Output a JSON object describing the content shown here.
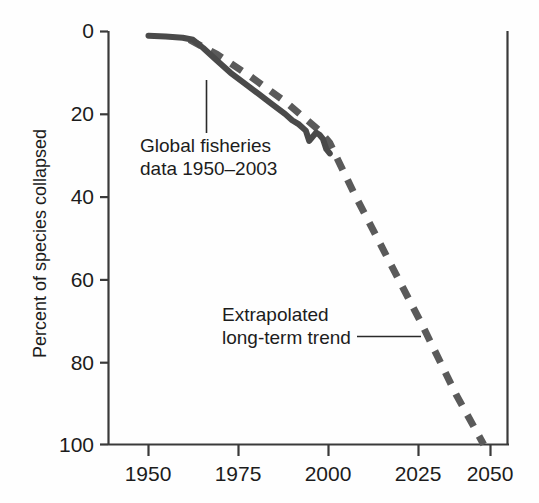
{
  "chart_data": {
    "type": "line",
    "title": "",
    "subtitle": "",
    "xlabel": "",
    "ylabel": "Percent of species collapsed",
    "xlim": [
      1950,
      2050
    ],
    "ylim": [
      0,
      100
    ],
    "y_axis_inverted": true,
    "grid": false,
    "legend_position": "none",
    "xticks": [
      1950,
      1975,
      2000,
      2025,
      2050
    ],
    "xtick_labels": [
      "1950",
      "1975",
      "2000",
      "2025",
      "2050"
    ],
    "yticks": [
      0,
      20,
      40,
      60,
      80,
      100
    ],
    "ytick_labels": [
      "0",
      "20",
      "40",
      "60",
      "80",
      "100"
    ],
    "series": [
      {
        "name": "Global fisheries data 1950-2003",
        "style": "solid",
        "color": "#4a4a4a",
        "linewidth": 6,
        "x": [
          1950,
          1955,
          1960,
          1963,
          1966,
          1970,
          1974,
          1978,
          1982,
          1986,
          1990,
          1992,
          1994,
          1996,
          1997,
          1999,
          2000,
          2001,
          2002,
          2003
        ],
        "y": [
          1,
          1.2,
          1.5,
          2,
          4,
          7,
          10,
          12.5,
          15,
          17.5,
          20,
          21.5,
          22.5,
          24,
          26.5,
          24.5,
          25,
          26,
          28.5,
          29.5
        ]
      },
      {
        "name": "Extrapolated long-term trend",
        "style": "dashed",
        "color": "#5a5a5a",
        "linewidth": 7,
        "x": [
          1962,
          1970,
          1980,
          1990,
          2000,
          2003,
          2010,
          2020,
          2030,
          2040,
          2048
        ],
        "y": [
          2,
          5.5,
          11,
          17,
          24,
          27,
          39,
          55,
          71,
          88,
          100
        ]
      }
    ],
    "annotations": [
      {
        "id": "fisheries-annotation",
        "lines": [
          "Global fisheries",
          "data 1950–2003"
        ],
        "text": "Global fisheries data 1950–2003",
        "leader": "vertical",
        "points_to_series": "Global fisheries data 1950-2003"
      },
      {
        "id": "extrapolation-annotation",
        "lines": [
          "Extrapolated",
          "long-term trend"
        ],
        "text": "Extrapolated long-term trend",
        "leader": "horizontal",
        "points_to_series": "Extrapolated long-term trend"
      }
    ],
    "colors": {
      "axis": "#3a3a3a",
      "text": "#1c1c1c",
      "solid_series": "#4a4a4a",
      "dashed_series": "#5a5a5a",
      "background": "#fefefe"
    }
  }
}
